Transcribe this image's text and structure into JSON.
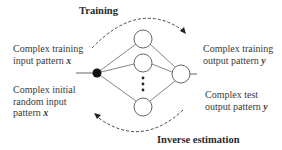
{
  "diagram": {
    "top_arrow_label": "Training",
    "bottom_arrow_label": "Inverse estimation",
    "left_top": {
      "line1": "Complex  training",
      "line2_prefix": "input pattern ",
      "var": "x"
    },
    "left_bottom": {
      "line1": "Complex initial",
      "line2": "random input",
      "line3_prefix": "pattern ",
      "var": "x"
    },
    "right_top": {
      "line1": "Complex training",
      "line2_prefix": "output pattern ",
      "var": "y"
    },
    "right_bottom": {
      "line1": "Complex test",
      "line2_prefix": "output pattern ",
      "var": "y"
    },
    "network": {
      "input_node": {
        "x": 97,
        "y": 73,
        "r": 4.5,
        "fill": "#111111"
      },
      "hidden_nodes": [
        {
          "x": 143,
          "y": 39,
          "r": 9
        },
        {
          "x": 143,
          "y": 63,
          "r": 9
        },
        {
          "x": 143,
          "y": 107,
          "r": 9
        }
      ],
      "output_node": {
        "x": 181,
        "y": 74,
        "r": 9
      },
      "ellipsis_dots": 3,
      "stroke_color": "#666666"
    }
  }
}
